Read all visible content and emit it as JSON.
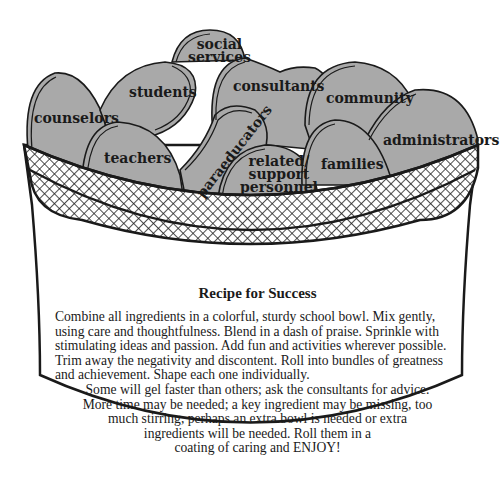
{
  "ingredients": [
    {
      "id": "counselors",
      "label": "counselors"
    },
    {
      "id": "students",
      "label": "students"
    },
    {
      "id": "social_services",
      "label": "social\nservices",
      "line1": "social",
      "line2": "services"
    },
    {
      "id": "consultants",
      "label": "consultants"
    },
    {
      "id": "community",
      "label": "community"
    },
    {
      "id": "administrators",
      "label": "administrators"
    },
    {
      "id": "teachers",
      "label": "teachers"
    },
    {
      "id": "paraeducators",
      "label": "paraeducators"
    },
    {
      "id": "related_support",
      "label": "related/ support personnel",
      "line1": "related/",
      "line2": "support",
      "line3": "personnel"
    },
    {
      "id": "families",
      "label": "families"
    }
  ],
  "recipe": {
    "title": "Recipe for Success",
    "paragraph": "Combine all ingredients in a colorful, sturdy school bowl. Mix gently, using care and thoughtfulness. Blend in a dash of praise. Sprinkle with stimulating ideas and passion. Add fun and activities wherever possible. Trim away the negativity and discontent. Roll into bundles of greatness and achievement. Shape each one individually.",
    "centered_lines": [
      "Some will gel faster than others; ask the consultants for advice.",
      "More time may be needed; a key ingredient may be missing, too",
      "much stirring, perhaps an extra bowl is needed or extra",
      "ingredients will be needed. Roll them in a",
      "coating of caring and ENJOY!"
    ]
  },
  "colors": {
    "stone": "#a9a9a9",
    "outline": "#1a1a1a",
    "bowl": "#ffffff"
  }
}
